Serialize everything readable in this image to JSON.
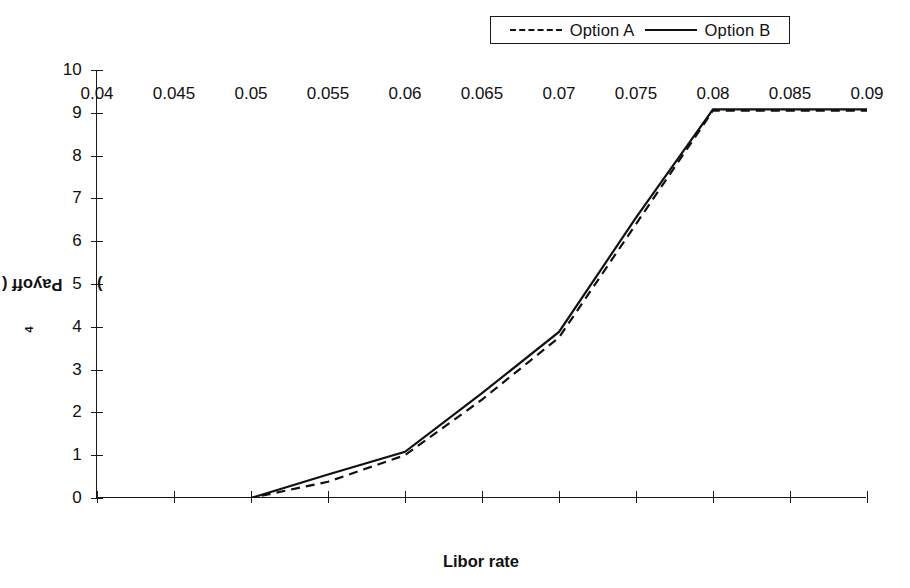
{
  "chart_data": {
    "type": "line",
    "title": "",
    "xlabel": "Libor rate",
    "ylabel": "Payoff ( x 10^4 )",
    "ylabel_base": "Payoff ( x 10",
    "ylabel_exp": "4",
    "ylabel_tail": " )",
    "xlim": [
      0.04,
      0.09
    ],
    "ylim": [
      0,
      10
    ],
    "grid": false,
    "legend_position": "top-right outside",
    "xticks": [
      0.04,
      0.045,
      0.05,
      0.055,
      0.06,
      0.065,
      0.07,
      0.075,
      0.08,
      0.085,
      0.09
    ],
    "xticklabels": [
      "0.04",
      "0.045",
      "0.05",
      "0.055",
      "0.06",
      "0.065",
      "0.07",
      "0.075",
      "0.08",
      "0.085",
      "0.09"
    ],
    "yticks": [
      0,
      1,
      2,
      3,
      4,
      5,
      6,
      7,
      8,
      9,
      10
    ],
    "yticklabels": [
      "0",
      "1",
      "2",
      "3",
      "4",
      "5",
      "6",
      "7",
      "8",
      "9",
      "10"
    ],
    "series": [
      {
        "name": "Option A",
        "style": "dashed",
        "color": "#111111",
        "x": [
          0.04,
          0.05,
          0.055,
          0.06,
          0.065,
          0.07,
          0.075,
          0.08,
          0.085,
          0.09
        ],
        "y": [
          0.0,
          0.0,
          0.38,
          1.0,
          2.3,
          3.75,
          6.4,
          9.05,
          9.05,
          9.05
        ]
      },
      {
        "name": "Option B",
        "style": "solid",
        "color": "#111111",
        "x": [
          0.04,
          0.05,
          0.055,
          0.06,
          0.065,
          0.07,
          0.075,
          0.08,
          0.085,
          0.09
        ],
        "y": [
          0.0,
          0.0,
          0.55,
          1.08,
          2.45,
          3.88,
          6.55,
          9.08,
          9.08,
          9.08
        ]
      }
    ]
  },
  "legend": {
    "entries": [
      {
        "label": "Option A",
        "style": "dashed"
      },
      {
        "label": "Option B",
        "style": "solid"
      }
    ]
  },
  "axes": {
    "x_title": "Libor rate",
    "y_title_base": "Payoff ( x 10",
    "y_title_exp": "4",
    "y_title_tail": " )"
  },
  "colors": {
    "line": "#111111",
    "axis": "#1a1a1a",
    "background": "#ffffff"
  }
}
